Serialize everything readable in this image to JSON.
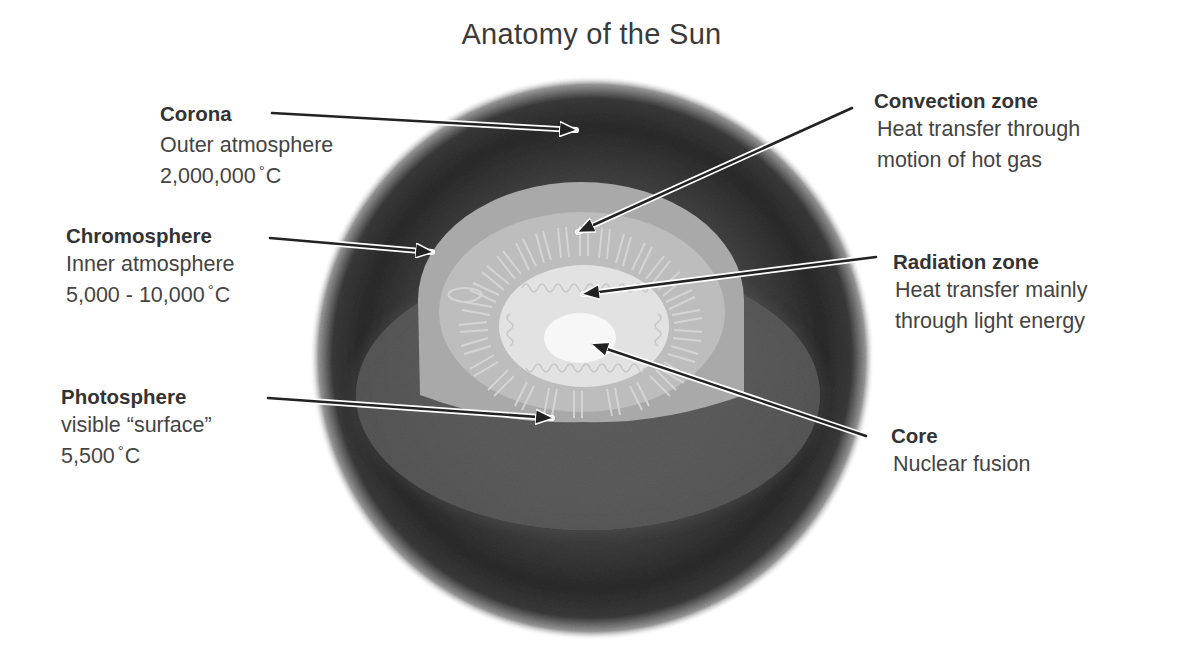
{
  "title": "Anatomy of the Sun",
  "colors": {
    "background": "#ffffff",
    "text": "#333333",
    "arrow": "#222222",
    "arrow_outline": "#ffffff",
    "corona": "#2a2a2a",
    "chromosphere": "#a8a8a8",
    "convection_zone": "#c2c2c2",
    "radiation_zone": "#e4e4e4",
    "core": "#f8f8f8",
    "photosphere": "#6a6a6a"
  },
  "labels": {
    "corona": {
      "name": "Corona",
      "desc1": "Outer atmosphere",
      "temp_value": "2,000,000",
      "temp_unit": "C",
      "degree_symbol": "°"
    },
    "chromosphere": {
      "name": "Chromosphere",
      "desc1": "Inner atmosphere",
      "temp_value": "5,000 - 10,000",
      "temp_unit": "C",
      "degree_symbol": "°"
    },
    "photosphere": {
      "name": "Photosphere",
      "desc1": "visible “surface”",
      "temp_value": "5,500",
      "temp_unit": "C",
      "degree_symbol": "°"
    },
    "convection_zone": {
      "name": "Convection zone",
      "desc1": "Heat transfer through",
      "desc2": "motion of hot gas"
    },
    "radiation_zone": {
      "name": "Radiation zone",
      "desc1": "Heat transfer mainly",
      "desc2": "through light energy"
    },
    "core": {
      "name": "Core",
      "desc1": "Nuclear fusion"
    }
  }
}
